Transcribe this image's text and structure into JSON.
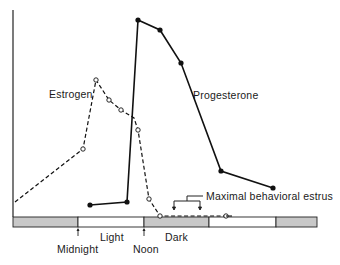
{
  "chart_data": {
    "type": "line",
    "title": "",
    "xlabel": "",
    "ylabel": "",
    "grid": false,
    "legend": "inline labels",
    "series": [
      {
        "name": "Estrogen",
        "style": "dashed",
        "marker": "open-circle",
        "points_px": [
          [
            15,
            202
          ],
          [
            83,
            149
          ],
          [
            96,
            80
          ],
          [
            109,
            100
          ],
          [
            121,
            110
          ],
          [
            134,
            118
          ],
          [
            138,
            130
          ],
          [
            149,
            199
          ],
          [
            160,
            216
          ],
          [
            226,
            216
          ]
        ],
        "marker_indices": [
          1,
          2,
          3,
          4,
          6,
          7,
          8,
          9
        ]
      },
      {
        "name": "Progesterone",
        "style": "solid",
        "marker": "filled-circle",
        "points_px": [
          [
            90,
            205
          ],
          [
            127,
            202
          ],
          [
            138,
            20
          ],
          [
            160,
            30
          ],
          [
            181,
            63
          ],
          [
            221,
            171
          ],
          [
            273,
            188
          ]
        ],
        "marker_indices": [
          0,
          1,
          2,
          3,
          4,
          5,
          6
        ]
      }
    ],
    "time_bar": {
      "segments": [
        {
          "phase": "Dark",
          "x0": 13,
          "x1": 78
        },
        {
          "phase": "Light",
          "x0": 78,
          "x1": 144
        },
        {
          "phase": "Dark",
          "x0": 144,
          "x1": 209
        },
        {
          "phase": "Light",
          "x0": 209,
          "x1": 276
        },
        {
          "phase": "Dark",
          "x0": 276,
          "x1": 317
        }
      ]
    },
    "annotations": [
      "Midnight",
      "Noon",
      "Light",
      "Dark",
      "Maximal behavioral estrus"
    ]
  },
  "labels": {
    "estrogen": "Estrogen",
    "progesterone": "Progesterone",
    "estrus": "Maximal behavioral estrus",
    "midnight": "Midnight",
    "light": "Light",
    "noon": "Noon",
    "dark": "Dark"
  },
  "colors": {
    "line": "#111111",
    "dark_fill": "#c8c8c8",
    "light_fill": "#ffffff"
  }
}
